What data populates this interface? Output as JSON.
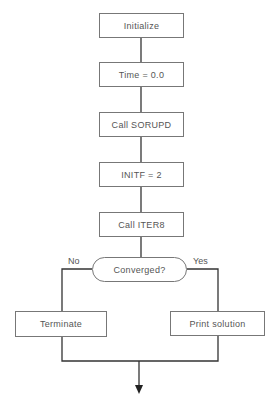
{
  "diagram": {
    "type": "flowchart",
    "steps": [
      {
        "id": "initialize",
        "label": "Initialize"
      },
      {
        "id": "time",
        "label": "Time = 0.0"
      },
      {
        "id": "sorupd",
        "label": "Call SORUPD"
      },
      {
        "id": "initf",
        "label": "INITF = 2"
      },
      {
        "id": "iter8",
        "label": "Call ITER8"
      }
    ],
    "decision": {
      "label": "Converged?",
      "no_label": "No",
      "yes_label": "Yes"
    },
    "branches": {
      "no": {
        "label": "Terminate"
      },
      "yes": {
        "label": "Print solution"
      }
    },
    "line_color": "#333333"
  }
}
